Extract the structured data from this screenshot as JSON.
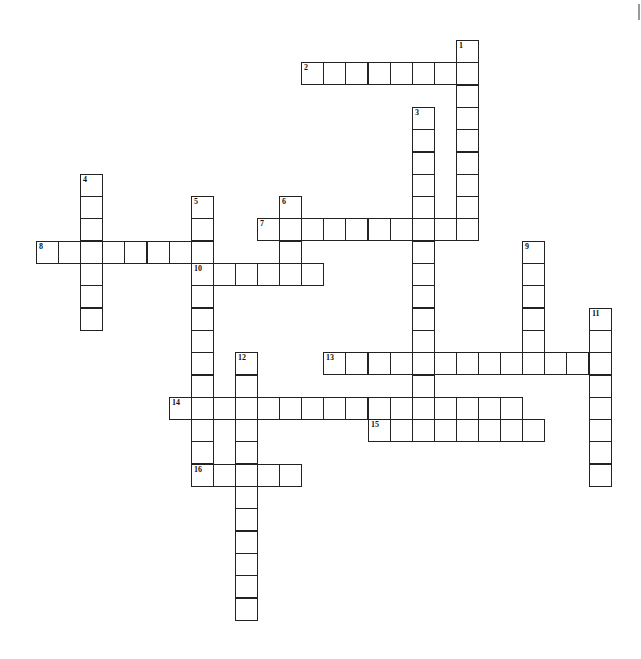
{
  "header": {
    "text": ""
  },
  "grid": {
    "origin_x": 36,
    "origin_y": 40,
    "pitch_x": 22.1,
    "pitch_y": 22.3,
    "cell_size": 23
  },
  "entries": [
    {
      "number": 1,
      "direction": "down",
      "row": 0,
      "col": 19,
      "length": 9
    },
    {
      "number": 2,
      "direction": "across",
      "row": 1,
      "col": 12,
      "length": 8
    },
    {
      "number": 3,
      "direction": "down",
      "row": 3,
      "col": 17,
      "length": 15
    },
    {
      "number": 4,
      "direction": "down",
      "row": 6,
      "col": 2,
      "length": 7
    },
    {
      "number": 5,
      "direction": "down",
      "row": 7,
      "col": 7,
      "length": 13
    },
    {
      "number": 6,
      "direction": "down",
      "row": 7,
      "col": 11,
      "length": 4
    },
    {
      "number": 7,
      "direction": "across",
      "row": 8,
      "col": 10,
      "length": 10
    },
    {
      "number": 8,
      "direction": "across",
      "row": 9,
      "col": 0,
      "length": 8
    },
    {
      "number": 9,
      "direction": "down",
      "row": 9,
      "col": 22,
      "length": 6
    },
    {
      "number": 10,
      "direction": "across",
      "row": 10,
      "col": 7,
      "length": 6
    },
    {
      "number": 11,
      "direction": "down",
      "row": 12,
      "col": 25,
      "length": 8
    },
    {
      "number": 12,
      "direction": "down",
      "row": 14,
      "col": 9,
      "length": 12
    },
    {
      "number": 13,
      "direction": "across",
      "row": 14,
      "col": 13,
      "length": 13
    },
    {
      "number": 14,
      "direction": "across",
      "row": 16,
      "col": 6,
      "length": 16
    },
    {
      "number": 15,
      "direction": "across",
      "row": 17,
      "col": 15,
      "length": 8
    },
    {
      "number": 16,
      "direction": "across",
      "row": 19,
      "col": 7,
      "length": 5
    }
  ]
}
